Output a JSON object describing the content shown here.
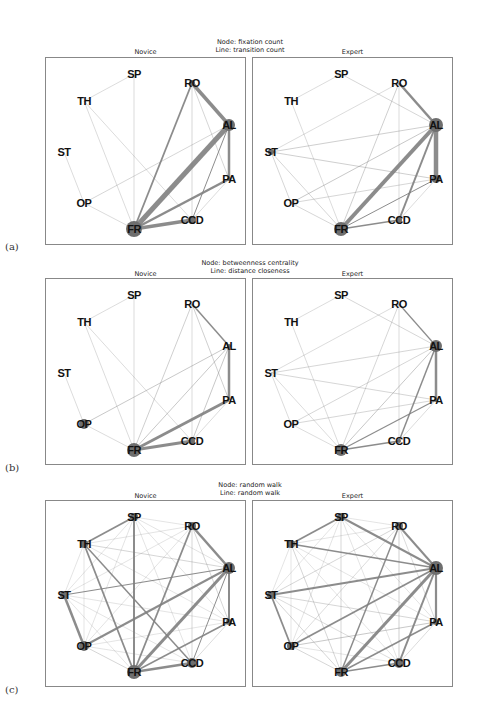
{
  "node_order": [
    "SP",
    "RO",
    "AL",
    "PA",
    "CCD",
    "FR",
    "OP",
    "ST",
    "TH"
  ],
  "node_positions": {
    "SP": [
      88,
      16
    ],
    "RO": [
      146,
      25
    ],
    "AL": [
      183,
      67
    ],
    "PA": [
      183,
      121
    ],
    "CCD": [
      146,
      162
    ],
    "FR": [
      88,
      171
    ],
    "OP": [
      38,
      145
    ],
    "ST": [
      18,
      94
    ],
    "TH": [
      38,
      43
    ]
  },
  "edge_color": "#808080",
  "node_color": "#6e6e6e",
  "rows": [
    {
      "label": "(a)",
      "title_line1": "Node: fixation count",
      "title_line2": "Line: transition count",
      "panels": [
        {
          "title": "Novice",
          "nodes": {
            "FR": 8,
            "AL": 6,
            "CCD": 4,
            "RO": 3,
            "PA": 2
          },
          "edges": [
            [
              "SP",
              "TH",
              0.5
            ],
            [
              "SP",
              "FR",
              0.5
            ],
            [
              "TH",
              "FR",
              0.5
            ],
            [
              "TH",
              "CCD",
              0.5
            ],
            [
              "ST",
              "OP",
              0.5
            ],
            [
              "OP",
              "FR",
              0.5
            ],
            [
              "OP",
              "AL",
              0.6
            ],
            [
              "RO",
              "AL",
              3.5
            ],
            [
              "RO",
              "FR",
              1.8
            ],
            [
              "RO",
              "CCD",
              0.6
            ],
            [
              "RO",
              "PA",
              0.6
            ],
            [
              "AL",
              "FR",
              5
            ],
            [
              "AL",
              "PA",
              2.5
            ],
            [
              "AL",
              "CCD",
              1
            ],
            [
              "PA",
              "FR",
              2.5
            ],
            [
              "PA",
              "CCD",
              0.5
            ],
            [
              "CCD",
              "FR",
              3.5
            ]
          ]
        },
        {
          "title": "Expert",
          "nodes": {
            "FR": 7,
            "AL": 7,
            "PA": 4,
            "CCD": 3,
            "ST": 3
          },
          "edges": [
            [
              "SP",
              "TH",
              0.5
            ],
            [
              "SP",
              "AL",
              0.6
            ],
            [
              "TH",
              "FR",
              0.5
            ],
            [
              "ST",
              "RO",
              0.5
            ],
            [
              "ST",
              "AL",
              0.7
            ],
            [
              "ST",
              "PA",
              0.7
            ],
            [
              "ST",
              "OP",
              0.6
            ],
            [
              "ST",
              "FR",
              0.6
            ],
            [
              "OP",
              "AL",
              0.8
            ],
            [
              "OP",
              "PA",
              0.6
            ],
            [
              "OP",
              "FR",
              0.6
            ],
            [
              "RO",
              "AL",
              2.5
            ],
            [
              "RO",
              "FR",
              0.7
            ],
            [
              "RO",
              "CCD",
              0.5
            ],
            [
              "AL",
              "FR",
              4
            ],
            [
              "AL",
              "PA",
              4.5
            ],
            [
              "AL",
              "CCD",
              2
            ],
            [
              "PA",
              "FR",
              1
            ],
            [
              "PA",
              "CCD",
              0.5
            ],
            [
              "CCD",
              "FR",
              1.5
            ]
          ]
        }
      ]
    },
    {
      "label": "(b)",
      "title_line1": "Node: betweenness centrality",
      "title_line2": "Line: distance closeness",
      "panels": [
        {
          "title": "Novice",
          "nodes": {
            "FR": 7,
            "OP": 5,
            "CCD": 3,
            "AL": 2
          },
          "edges": [
            [
              "SP",
              "TH",
              0.5
            ],
            [
              "SP",
              "FR",
              0.5
            ],
            [
              "TH",
              "FR",
              0.5
            ],
            [
              "TH",
              "CCD",
              0.5
            ],
            [
              "ST",
              "OP",
              0.5
            ],
            [
              "OP",
              "FR",
              0.5
            ],
            [
              "OP",
              "AL",
              0.8
            ],
            [
              "RO",
              "AL",
              1.5
            ],
            [
              "RO",
              "FR",
              0.7
            ],
            [
              "RO",
              "CCD",
              0.5
            ],
            [
              "RO",
              "PA",
              0.7
            ],
            [
              "AL",
              "FR",
              0.8
            ],
            [
              "AL",
              "PA",
              2.5
            ],
            [
              "AL",
              "CCD",
              0.8
            ],
            [
              "PA",
              "FR",
              2.8
            ],
            [
              "PA",
              "CCD",
              0.5
            ],
            [
              "CCD",
              "FR",
              3
            ]
          ]
        },
        {
          "title": "Expert",
          "nodes": {
            "AL": 6,
            "FR": 6,
            "PA": 2,
            "CCD": 2
          },
          "edges": [
            [
              "SP",
              "TH",
              0.5
            ],
            [
              "SP",
              "AL",
              0.6
            ],
            [
              "TH",
              "FR",
              0.5
            ],
            [
              "ST",
              "RO",
              0.5
            ],
            [
              "ST",
              "AL",
              0.6
            ],
            [
              "ST",
              "PA",
              0.6
            ],
            [
              "ST",
              "OP",
              0.5
            ],
            [
              "ST",
              "FR",
              0.5
            ],
            [
              "OP",
              "AL",
              0.6
            ],
            [
              "OP",
              "PA",
              0.6
            ],
            [
              "OP",
              "FR",
              0.5
            ],
            [
              "RO",
              "AL",
              1.2
            ],
            [
              "RO",
              "FR",
              0.6
            ],
            [
              "RO",
              "CCD",
              0.5
            ],
            [
              "AL",
              "FR",
              0.8
            ],
            [
              "AL",
              "PA",
              2.5
            ],
            [
              "AL",
              "CCD",
              1.5
            ],
            [
              "PA",
              "FR",
              1.2
            ],
            [
              "PA",
              "CCD",
              0.5
            ],
            [
              "CCD",
              "FR",
              1.5
            ]
          ]
        }
      ]
    },
    {
      "label": "(c)",
      "title_line1": "Node: random walk",
      "title_line2": "Line: random walk",
      "panels": [
        {
          "title": "Novice",
          "nodes": {
            "FR": 7,
            "AL": 6,
            "OP": 5,
            "CCD": 5,
            "RO": 4,
            "TH": 4,
            "SP": 4,
            "ST": 4,
            "PA": 3
          },
          "edges": [
            [
              "SP",
              "TH",
              1.8
            ],
            [
              "SP",
              "FR",
              2
            ],
            [
              "SP",
              "RO",
              0.4
            ],
            [
              "SP",
              "AL",
              0.4
            ],
            [
              "SP",
              "PA",
              0.4
            ],
            [
              "SP",
              "CCD",
              0.4
            ],
            [
              "SP",
              "OP",
              0.4
            ],
            [
              "SP",
              "ST",
              0.4
            ],
            [
              "TH",
              "FR",
              1.8
            ],
            [
              "TH",
              "CCD",
              1.5
            ],
            [
              "TH",
              "AL",
              0.6
            ],
            [
              "TH",
              "RO",
              0.4
            ],
            [
              "TH",
              "PA",
              0.4
            ],
            [
              "TH",
              "OP",
              0.4
            ],
            [
              "TH",
              "ST",
              0.4
            ],
            [
              "ST",
              "OP",
              2.5
            ],
            [
              "ST",
              "AL",
              1.2
            ],
            [
              "ST",
              "RO",
              0.4
            ],
            [
              "ST",
              "PA",
              0.4
            ],
            [
              "ST",
              "CCD",
              0.4
            ],
            [
              "ST",
              "FR",
              0.4
            ],
            [
              "OP",
              "AL",
              2
            ],
            [
              "OP",
              "FR",
              0.6
            ],
            [
              "OP",
              "RO",
              0.4
            ],
            [
              "OP",
              "PA",
              0.4
            ],
            [
              "OP",
              "CCD",
              0.4
            ],
            [
              "RO",
              "AL",
              2.5
            ],
            [
              "RO",
              "FR",
              1.8
            ],
            [
              "RO",
              "CCD",
              0.6
            ],
            [
              "RO",
              "PA",
              0.6
            ],
            [
              "AL",
              "FR",
              3
            ],
            [
              "AL",
              "PA",
              2
            ],
            [
              "AL",
              "CCD",
              1
            ],
            [
              "PA",
              "FR",
              1.5
            ],
            [
              "PA",
              "CCD",
              0.5
            ],
            [
              "CCD",
              "FR",
              2.5
            ]
          ]
        },
        {
          "title": "Expert",
          "nodes": {
            "AL": 7,
            "FR": 5,
            "CCD": 5,
            "OP": 4,
            "ST": 4,
            "SP": 4,
            "TH": 4,
            "RO": 4,
            "PA": 3
          },
          "edges": [
            [
              "SP",
              "TH",
              1.8
            ],
            [
              "SP",
              "AL",
              2
            ],
            [
              "SP",
              "FR",
              0.6
            ],
            [
              "SP",
              "RO",
              0.4
            ],
            [
              "SP",
              "PA",
              0.4
            ],
            [
              "SP",
              "CCD",
              0.4
            ],
            [
              "SP",
              "OP",
              0.4
            ],
            [
              "SP",
              "ST",
              0.4
            ],
            [
              "TH",
              "AL",
              1.5
            ],
            [
              "TH",
              "FR",
              0.6
            ],
            [
              "TH",
              "CCD",
              0.4
            ],
            [
              "TH",
              "RO",
              0.4
            ],
            [
              "TH",
              "PA",
              0.4
            ],
            [
              "TH",
              "OP",
              0.4
            ],
            [
              "TH",
              "ST",
              0.4
            ],
            [
              "ST",
              "AL",
              1.8
            ],
            [
              "ST",
              "OP",
              1.8
            ],
            [
              "ST",
              "RO",
              0.6
            ],
            [
              "ST",
              "PA",
              0.6
            ],
            [
              "ST",
              "FR",
              0.6
            ],
            [
              "ST",
              "CCD",
              0.5
            ],
            [
              "OP",
              "AL",
              1.8
            ],
            [
              "OP",
              "PA",
              0.8
            ],
            [
              "OP",
              "FR",
              0.6
            ],
            [
              "OP",
              "RO",
              0.5
            ],
            [
              "OP",
              "CCD",
              0.4
            ],
            [
              "RO",
              "AL",
              2
            ],
            [
              "RO",
              "FR",
              1.5
            ],
            [
              "RO",
              "CCD",
              0.7
            ],
            [
              "RO",
              "PA",
              0.5
            ],
            [
              "AL",
              "FR",
              3
            ],
            [
              "AL",
              "PA",
              2.2
            ],
            [
              "AL",
              "CCD",
              2
            ],
            [
              "PA",
              "FR",
              1.5
            ],
            [
              "PA",
              "CCD",
              0.5
            ],
            [
              "CCD",
              "FR",
              1.5
            ]
          ]
        }
      ]
    }
  ]
}
